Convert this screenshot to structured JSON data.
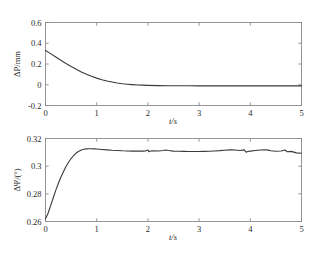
{
  "figure": {
    "background": "#ffffff",
    "curve_color": "#3a3a3a",
    "axis_color": "#8c8c8c",
    "panel_count": 2
  },
  "chart_data": [
    {
      "id": "top",
      "type": "line",
      "title": "",
      "xlabel": "t/s",
      "ylabel": "ΔP/mm",
      "xlim": [
        0,
        5
      ],
      "ylim": [
        -0.2,
        0.6
      ],
      "xticks": [
        0,
        1,
        2,
        3,
        4,
        5
      ],
      "xticklabels": [
        "0",
        "1",
        "2",
        "3",
        "4",
        "5"
      ],
      "yticks": [
        -0.2,
        0,
        0.2,
        0.4,
        0.6
      ],
      "yticklabels": [
        "-0.2",
        "0",
        "0.2",
        "0.4",
        "0.6"
      ],
      "grid": false,
      "legend": null,
      "series": [
        {
          "name": "ΔP",
          "x": [
            0,
            0.1,
            0.2,
            0.3,
            0.4,
            0.5,
            0.6,
            0.7,
            0.8,
            0.9,
            1.0,
            1.1,
            1.2,
            1.3,
            1.4,
            1.5,
            1.6,
            1.7,
            1.8,
            1.9,
            2.0,
            2.2,
            2.4,
            2.6,
            2.8,
            3.0,
            3.2,
            3.4,
            3.6,
            3.8,
            4.0,
            4.2,
            4.4,
            4.6,
            4.8,
            5.0
          ],
          "values": [
            0.33,
            0.3,
            0.268,
            0.236,
            0.205,
            0.176,
            0.149,
            0.124,
            0.102,
            0.082,
            0.064,
            0.049,
            0.036,
            0.026,
            0.017,
            0.01,
            0.005,
            0.001,
            -0.002,
            -0.004,
            -0.006,
            -0.008,
            -0.009,
            -0.01,
            -0.01,
            -0.011,
            -0.011,
            -0.011,
            -0.011,
            -0.011,
            -0.011,
            -0.011,
            -0.011,
            -0.011,
            -0.011,
            -0.011
          ]
        }
      ]
    },
    {
      "id": "bottom",
      "type": "line",
      "title": "",
      "xlabel": "t/s",
      "ylabel": "ΔΨ/(°)",
      "xlim": [
        0,
        5
      ],
      "ylim": [
        0.26,
        0.32
      ],
      "xticks": [
        0,
        1,
        2,
        3,
        4,
        5
      ],
      "xticklabels": [
        "0",
        "1",
        "2",
        "3",
        "4",
        "5"
      ],
      "yticks": [
        0.26,
        0.28,
        0.3,
        0.32
      ],
      "yticklabels": [
        "0.26",
        "0.28",
        "0.3",
        "0.32"
      ],
      "grid": false,
      "legend": null,
      "series": [
        {
          "name": "ΔΨ",
          "x": [
            0,
            0.05,
            0.1,
            0.15,
            0.2,
            0.25,
            0.3,
            0.35,
            0.4,
            0.45,
            0.5,
            0.55,
            0.6,
            0.65,
            0.7,
            0.75,
            0.8,
            0.85,
            0.9,
            0.95,
            1.0,
            1.1,
            1.2,
            1.3,
            1.4,
            1.5,
            1.6,
            1.7,
            1.8,
            1.9,
            1.95,
            2.0,
            2.02,
            2.05,
            2.1,
            2.2,
            2.3,
            2.35,
            2.4,
            2.5,
            2.6,
            2.7,
            2.8,
            2.9,
            3.0,
            3.1,
            3.2,
            3.3,
            3.4,
            3.5,
            3.6,
            3.65,
            3.7,
            3.8,
            3.88,
            3.92,
            3.95,
            4.0,
            4.1,
            4.2,
            4.3,
            4.35,
            4.4,
            4.5,
            4.6,
            4.68,
            4.72,
            4.8,
            4.9,
            5.0
          ],
          "values": [
            0.262,
            0.266,
            0.2715,
            0.277,
            0.2825,
            0.2875,
            0.292,
            0.296,
            0.2998,
            0.3028,
            0.3055,
            0.3077,
            0.3095,
            0.3108,
            0.3117,
            0.3122,
            0.3125,
            0.3126,
            0.3126,
            0.3125,
            0.3124,
            0.3121,
            0.3118,
            0.3115,
            0.3113,
            0.3111,
            0.311,
            0.3109,
            0.3109,
            0.3109,
            0.311,
            0.3117,
            0.3105,
            0.311,
            0.3111,
            0.311,
            0.3113,
            0.3117,
            0.3113,
            0.3109,
            0.3108,
            0.3107,
            0.3106,
            0.3106,
            0.3106,
            0.3107,
            0.3108,
            0.311,
            0.3112,
            0.3115,
            0.3118,
            0.3119,
            0.3117,
            0.3113,
            0.3118,
            0.3101,
            0.3106,
            0.3109,
            0.3113,
            0.3117,
            0.3119,
            0.3116,
            0.3111,
            0.3108,
            0.311,
            0.3117,
            0.3104,
            0.3107,
            0.3096,
            0.3093
          ]
        }
      ]
    }
  ]
}
